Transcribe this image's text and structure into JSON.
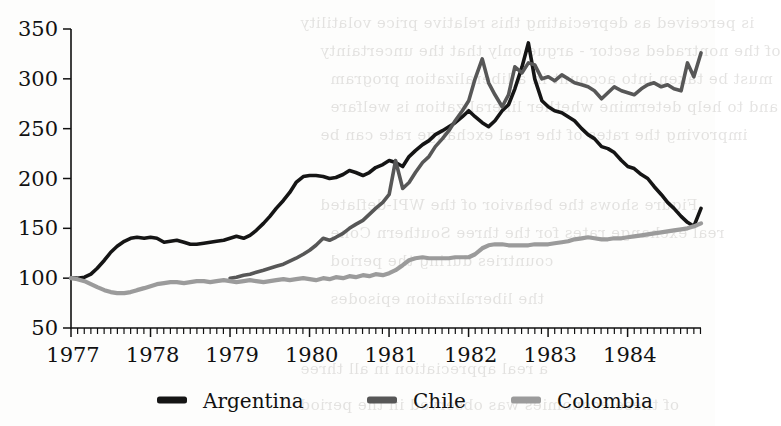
{
  "figure": {
    "background_color": "#fdfdfc",
    "axis_color": "#111111"
  },
  "bleed_text": [
    {
      "text": "is perceived as depreciating this relative price volatility",
      "x": 300,
      "y": 14
    },
    {
      "text": "of the nontraded sector -  argue only that the uncertainty",
      "x": 320,
      "y": 42
    },
    {
      "text": "must be taken into account in a liberalization program",
      "x": 330,
      "y": 70
    },
    {
      "text": "and to help determine whether liberalization is welfare",
      "x": 330,
      "y": 98
    },
    {
      "text": "improving the rates of the real exchange rate can be",
      "x": 320,
      "y": 126
    },
    {
      "text": "Figure shows the behavior of the WPI-deflated",
      "x": 320,
      "y": 196
    },
    {
      "text": "real exchange rates for the three Southern Cone",
      "x": 330,
      "y": 224
    },
    {
      "text": "countries during the period",
      "x": 330,
      "y": 252
    },
    {
      "text": "the liberalization episodes",
      "x": 330,
      "y": 290
    },
    {
      "text": "a real appreciation in all three",
      "x": 300,
      "y": 360
    },
    {
      "text": "of these economies was observed in the period",
      "x": 300,
      "y": 396
    }
  ],
  "chart_data": {
    "type": "line",
    "title": "",
    "xlabel": "",
    "ylabel": "",
    "xlim": [
      1977.0,
      1984.92
    ],
    "ylim": [
      50,
      350
    ],
    "grid": false,
    "legend_position": "bottom",
    "y_ticks": [
      50,
      100,
      150,
      200,
      250,
      300,
      350
    ],
    "x_ticks": [
      1977,
      1978,
      1979,
      1980,
      1981,
      1982,
      1983,
      1984
    ],
    "x_tick_labels": [
      "1977",
      "1978",
      "1979",
      "1980",
      "1981",
      "1982",
      "1983",
      "1984"
    ],
    "minor_x_tick_interval": 0.0833,
    "series": [
      {
        "name": "Argentina",
        "color": "#151515",
        "width": 3.6,
        "x": [
          1977.0,
          1977.08,
          1977.17,
          1977.25,
          1977.33,
          1977.42,
          1977.5,
          1977.58,
          1977.67,
          1977.75,
          1977.83,
          1977.92,
          1978.0,
          1978.08,
          1978.17,
          1978.25,
          1978.33,
          1978.42,
          1978.5,
          1978.58,
          1978.67,
          1978.75,
          1978.83,
          1978.92,
          1979.0,
          1979.08,
          1979.17,
          1979.25,
          1979.33,
          1979.42,
          1979.5,
          1979.58,
          1979.67,
          1979.75,
          1979.83,
          1979.92,
          1980.0,
          1980.08,
          1980.17,
          1980.25,
          1980.33,
          1980.42,
          1980.5,
          1980.58,
          1980.67,
          1980.75,
          1980.83,
          1980.92,
          1981.0,
          1981.08,
          1981.17,
          1981.25,
          1981.33,
          1981.42,
          1981.5,
          1981.58,
          1981.67,
          1981.75,
          1981.83,
          1981.92,
          1982.0,
          1982.08,
          1982.17,
          1982.25,
          1982.33,
          1982.42,
          1982.5,
          1982.58,
          1982.67,
          1982.75,
          1982.83,
          1982.92,
          1983.0,
          1983.08,
          1983.17,
          1983.25,
          1983.33,
          1983.42,
          1983.5,
          1983.58,
          1983.67,
          1983.75,
          1983.83,
          1983.92,
          1984.0,
          1984.08,
          1984.17,
          1984.25,
          1984.33,
          1984.42,
          1984.5,
          1984.58,
          1984.67,
          1984.75,
          1984.83,
          1984.92
        ],
        "y": [
          100,
          100,
          101,
          104,
          110,
          118,
          126,
          132,
          137,
          140,
          141,
          140,
          141,
          140,
          136,
          137,
          138,
          136,
          134,
          134,
          135,
          136,
          137,
          138,
          140,
          142,
          140,
          143,
          148,
          155,
          162,
          170,
          178,
          186,
          196,
          202,
          203,
          203,
          202,
          200,
          201,
          204,
          208,
          206,
          203,
          206,
          211,
          214,
          218,
          216,
          212,
          222,
          228,
          234,
          238,
          244,
          248,
          252,
          256,
          262,
          268,
          262,
          256,
          252,
          258,
          268,
          274,
          290,
          312,
          336,
          300,
          278,
          272,
          268,
          266,
          262,
          258,
          250,
          244,
          240,
          232,
          230,
          226,
          218,
          212,
          210,
          204,
          200,
          192,
          184,
          176,
          170,
          162,
          156,
          152,
          170
        ]
      },
      {
        "name": "Chile",
        "color": "#575757",
        "width": 3.6,
        "x": [
          1979.0,
          1979.08,
          1979.17,
          1979.25,
          1979.33,
          1979.42,
          1979.5,
          1979.58,
          1979.67,
          1979.75,
          1979.83,
          1979.92,
          1980.0,
          1980.08,
          1980.17,
          1980.25,
          1980.33,
          1980.42,
          1980.5,
          1980.58,
          1980.67,
          1980.75,
          1980.83,
          1980.92,
          1981.0,
          1981.08,
          1981.17,
          1981.25,
          1981.33,
          1981.42,
          1981.5,
          1981.58,
          1981.67,
          1981.75,
          1981.83,
          1981.92,
          1982.0,
          1982.08,
          1982.17,
          1982.25,
          1982.33,
          1982.42,
          1982.5,
          1982.58,
          1982.67,
          1982.75,
          1982.83,
          1982.92,
          1983.0,
          1983.08,
          1983.17,
          1983.25,
          1983.33,
          1983.42,
          1983.5,
          1983.58,
          1983.67,
          1983.75,
          1983.83,
          1983.92,
          1984.0,
          1984.08,
          1984.17,
          1984.25,
          1984.33,
          1984.42,
          1984.5,
          1984.58,
          1984.67,
          1984.75,
          1984.83,
          1984.92
        ],
        "y": [
          100,
          101,
          103,
          104,
          106,
          108,
          110,
          112,
          114,
          117,
          120,
          124,
          128,
          133,
          140,
          138,
          141,
          145,
          150,
          154,
          158,
          164,
          170,
          176,
          184,
          218,
          190,
          196,
          206,
          216,
          222,
          232,
          240,
          248,
          258,
          268,
          278,
          300,
          320,
          296,
          284,
          272,
          284,
          312,
          306,
          316,
          314,
          300,
          302,
          298,
          304,
          300,
          296,
          294,
          292,
          288,
          280,
          286,
          292,
          288,
          286,
          284,
          290,
          294,
          296,
          292,
          294,
          290,
          288,
          316,
          302,
          326
        ]
      },
      {
        "name": "Colombia",
        "color": "#9b9b9b",
        "width": 4.2,
        "x": [
          1977.0,
          1977.08,
          1977.17,
          1977.25,
          1977.33,
          1977.42,
          1977.5,
          1977.58,
          1977.67,
          1977.75,
          1977.83,
          1977.92,
          1978.0,
          1978.08,
          1978.17,
          1978.25,
          1978.33,
          1978.42,
          1978.5,
          1978.58,
          1978.67,
          1978.75,
          1978.83,
          1978.92,
          1979.0,
          1979.08,
          1979.17,
          1979.25,
          1979.33,
          1979.42,
          1979.5,
          1979.58,
          1979.67,
          1979.75,
          1979.83,
          1979.92,
          1980.0,
          1980.08,
          1980.17,
          1980.25,
          1980.33,
          1980.42,
          1980.5,
          1980.58,
          1980.67,
          1980.75,
          1980.83,
          1980.92,
          1981.0,
          1981.08,
          1981.17,
          1981.25,
          1981.33,
          1981.42,
          1981.5,
          1981.58,
          1981.67,
          1981.75,
          1981.83,
          1981.92,
          1982.0,
          1982.08,
          1982.17,
          1982.25,
          1982.33,
          1982.42,
          1982.5,
          1982.58,
          1982.67,
          1982.75,
          1982.83,
          1982.92,
          1983.0,
          1983.08,
          1983.17,
          1983.25,
          1983.33,
          1983.42,
          1983.5,
          1983.58,
          1983.67,
          1983.75,
          1983.83,
          1983.92,
          1984.0,
          1984.08,
          1984.17,
          1984.25,
          1984.33,
          1984.42,
          1984.5,
          1984.58,
          1984.67,
          1984.75,
          1984.83,
          1984.92
        ],
        "y": [
          100,
          99,
          97,
          94,
          91,
          88,
          86,
          85,
          85,
          86,
          88,
          90,
          92,
          94,
          95,
          96,
          96,
          95,
          96,
          97,
          97,
          96,
          97,
          98,
          97,
          96,
          97,
          98,
          97,
          96,
          97,
          98,
          99,
          98,
          99,
          100,
          99,
          98,
          100,
          99,
          101,
          100,
          102,
          101,
          103,
          102,
          104,
          103,
          105,
          108,
          113,
          118,
          120,
          121,
          120,
          120,
          120,
          120,
          121,
          121,
          121,
          124,
          130,
          133,
          134,
          134,
          133,
          133,
          133,
          133,
          134,
          134,
          134,
          135,
          136,
          137,
          139,
          140,
          141,
          140,
          139,
          139,
          140,
          140,
          141,
          142,
          143,
          144,
          145,
          146,
          147,
          148,
          149,
          150,
          152,
          155
        ]
      }
    ]
  },
  "legend": {
    "items": [
      {
        "label": "Argentina",
        "color": "#151515"
      },
      {
        "label": "Chile",
        "color": "#575757"
      },
      {
        "label": "Colombia",
        "color": "#9b9b9b"
      }
    ]
  }
}
